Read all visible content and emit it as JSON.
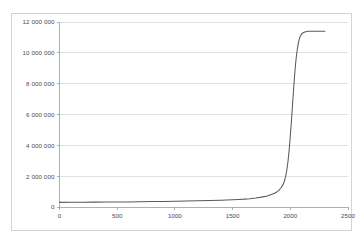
{
  "chart_data": {
    "type": "line",
    "title": "",
    "subtitle": "",
    "xlabel": "",
    "ylabel": "",
    "xlim": [
      0,
      2500
    ],
    "ylim": [
      0,
      12000000
    ],
    "grid": "horizontal",
    "legend": "none",
    "line_color": "#595959",
    "gridline_color": "#d9d9d9",
    "axis_color": "#a6a6a6",
    "plot_background": "#ffffff",
    "x_ticks": [
      0,
      500,
      1000,
      1500,
      2000,
      2500
    ],
    "x_tick_labels": [
      "0",
      "500",
      "1000",
      "1500",
      "2000",
      "2500"
    ],
    "y_ticks": [
      0,
      2000000,
      4000000,
      6000000,
      8000000,
      10000000,
      12000000
    ],
    "y_tick_labels": [
      "0",
      "2 000 000",
      "4 000 000",
      "6 000 000",
      "8 000 000",
      "10 000 000",
      "12 000 000"
    ],
    "series": [
      {
        "name": "",
        "color": "#595959",
        "x": [
          0,
          100,
          200,
          300,
          400,
          500,
          600,
          700,
          800,
          900,
          1000,
          1100,
          1200,
          1300,
          1400,
          1500,
          1550,
          1600,
          1650,
          1700,
          1750,
          1800,
          1830,
          1860,
          1880,
          1900,
          1920,
          1940,
          1950,
          1960,
          1970,
          1980,
          1990,
          2000,
          2010,
          2020,
          2030,
          2040,
          2050,
          2060,
          2070,
          2080,
          2090,
          2100,
          2120,
          2140,
          2160,
          2180,
          2200,
          2250,
          2300
        ],
        "y": [
          300000,
          305000,
          310000,
          315000,
          320000,
          325000,
          330000,
          340000,
          350000,
          360000,
          375000,
          390000,
          405000,
          420000,
          440000,
          470000,
          490000,
          510000,
          540000,
          580000,
          640000,
          720000,
          790000,
          880000,
          960000,
          1080000,
          1250000,
          1500000,
          1700000,
          2000000,
          2400000,
          2950000,
          3700000,
          4600000,
          5600000,
          6700000,
          7800000,
          8800000,
          9600000,
          10200000,
          10650000,
          10950000,
          11130000,
          11250000,
          11340000,
          11380000,
          11400000,
          11400000,
          11400000,
          11400000,
          11400000
        ]
      }
    ]
  },
  "axis_geometry": {
    "plot_left_px": 59.5,
    "plot_right_px": 348,
    "plot_top_px": 22,
    "plot_bottom_px": 207
  }
}
